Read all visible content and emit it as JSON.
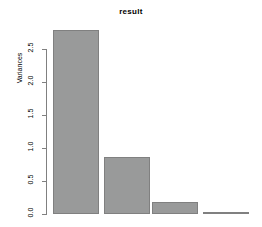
{
  "chart_data": {
    "type": "bar",
    "title": "result",
    "xlabel": "",
    "ylabel": "Variances",
    "categories": [
      "Comp.1",
      "Comp.2",
      "Comp.3",
      "Comp.4"
    ],
    "values": [
      2.79,
      0.86,
      0.18,
      0.03
    ],
    "ylim": [
      0.0,
      2.79
    ],
    "yticks": [
      0.0,
      0.5,
      1.0,
      1.5,
      2.0,
      2.5
    ],
    "ytick_labels": [
      "0.0",
      "0.5",
      "1.0",
      "1.5",
      "2.0",
      "2.5"
    ],
    "grid": false,
    "legend": null,
    "bar_fill_color": "#999a9a",
    "bar_border_color": "#808080",
    "axis_color": "#808080",
    "background_color": "#ffffff"
  }
}
